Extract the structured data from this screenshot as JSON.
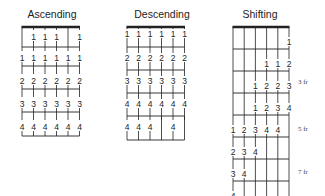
{
  "diagrams": [
    {
      "title": "Ascending",
      "strings": 6,
      "rows": [
        {
          "type": "fret_row",
          "fingers": [
            null,
            1,
            1,
            1,
            null,
            1
          ]
        },
        {
          "type": "fret_row",
          "fingers": [
            1,
            1,
            1,
            1,
            1,
            1
          ]
        },
        {
          "type": "fret_row",
          "fingers": [
            2,
            2,
            2,
            2,
            2,
            2
          ]
        },
        {
          "type": "fret_row",
          "fingers": [
            3,
            3,
            3,
            3,
            3,
            3
          ]
        },
        {
          "type": "fret_row",
          "fingers": [
            4,
            4,
            4,
            4,
            4,
            4
          ]
        }
      ]
    },
    {
      "title": "Descending",
      "strings": 6,
      "rows": [
        {
          "type": "fret_row",
          "fingers": [
            1,
            1,
            1,
            1,
            1,
            1
          ]
        },
        {
          "type": "fret_row",
          "fingers": [
            2,
            2,
            2,
            2,
            2,
            2
          ]
        },
        {
          "type": "fret_row",
          "fingers": [
            3,
            3,
            3,
            3,
            3,
            3
          ]
        },
        {
          "type": "fret_row",
          "fingers": [
            4,
            4,
            4,
            4,
            4,
            4
          ]
        },
        {
          "type": "fret_row",
          "fingers": [
            4,
            4,
            4,
            null,
            4,
            null
          ]
        }
      ]
    },
    {
      "title": "Shifting",
      "strings": 6,
      "rows": [
        {
          "fingers": [
            null,
            null,
            null,
            null,
            null,
            1
          ]
        },
        {
          "fingers": [
            null,
            null,
            null,
            1,
            1,
            2
          ]
        },
        {
          "fingers": [
            null,
            null,
            1,
            2,
            2,
            3
          ],
          "fret_label": "3 fr"
        },
        {
          "fingers": [
            null,
            null,
            1,
            2,
            3,
            4
          ]
        },
        {
          "fingers": [
            1,
            2,
            3,
            4,
            4,
            null
          ],
          "fret_label": "5 fr"
        },
        {
          "fingers": [
            2,
            3,
            4,
            null,
            null,
            null
          ]
        },
        {
          "fingers": [
            3,
            4,
            null,
            null,
            null,
            null
          ],
          "fret_label": "7 fr"
        },
        {
          "fingers": [
            4,
            null,
            null,
            null,
            null,
            null
          ]
        }
      ]
    }
  ],
  "labels": {
    "asc": "Ascending",
    "desc": "Descending",
    "shift": "Shifting",
    "fr3": "3 fr",
    "fr5": "5 fr",
    "fr7": "7 fr"
  }
}
